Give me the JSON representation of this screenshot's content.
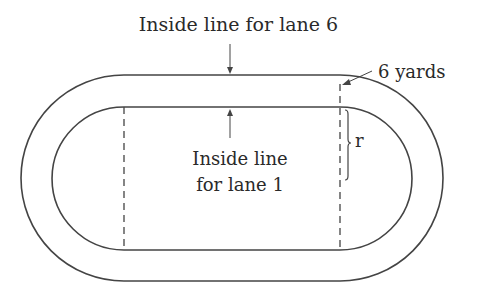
{
  "diagram": {
    "labels": {
      "lane6": "Inside line for lane 6",
      "lane1_line1": "Inside line",
      "lane1_line2": "for lane 1",
      "yards": "6 yards",
      "radius": "r"
    },
    "colors": {
      "stroke": "#444444",
      "background": "#ffffff",
      "text": "#2a2a2a"
    }
  }
}
